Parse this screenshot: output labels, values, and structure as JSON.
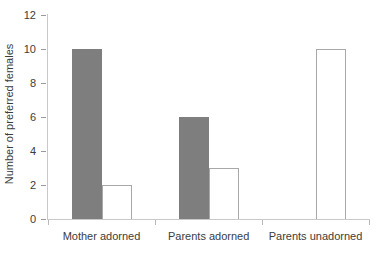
{
  "chart_data": {
    "type": "bar",
    "title": "",
    "subtitle": "",
    "xlabel": "",
    "ylabel": "Number of preferred females",
    "categories": [
      "Mother adorned",
      "Parents adorned",
      "Parents unadorned"
    ],
    "series": [
      {
        "name": "adorned-female",
        "style": "filled-gray",
        "color": "#7e7e7e",
        "values": [
          10,
          6,
          0
        ]
      },
      {
        "name": "unadorned-female",
        "style": "hollow-outline",
        "color": "#ffffff",
        "values": [
          2,
          3,
          10
        ]
      }
    ],
    "ylim": [
      0,
      12
    ],
    "ytick_values": [
      0,
      2,
      4,
      6,
      8,
      10,
      12
    ],
    "ytick_labels": [
      "0",
      "2",
      "4",
      "6",
      "8",
      "10",
      "12"
    ],
    "grid": false,
    "legend": "none",
    "annotations": []
  },
  "colors": {
    "background": "#ffffff",
    "axis": "#c9c9c9",
    "text": "#3c3c3c",
    "bar_fill": "#7e7e7e",
    "bar_outline": "#a8a8a8"
  }
}
